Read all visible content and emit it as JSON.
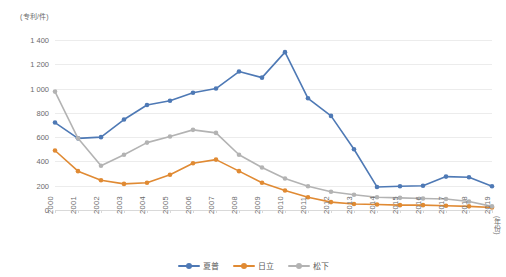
{
  "chart_data": {
    "type": "line",
    "title": "",
    "xlabel": "(年份)",
    "ylabel": "(专利/件)",
    "ylim": [
      0,
      1400
    ],
    "yticks": [
      "0",
      "200",
      "400",
      "600",
      "800",
      "1 000",
      "1 200",
      "1 400"
    ],
    "ytick_values": [
      0,
      200,
      400,
      600,
      800,
      1000,
      1200,
      1400
    ],
    "grid": true,
    "legend_position": "bottom-center",
    "categories": [
      "2000",
      "2001",
      "2002",
      "2003",
      "2004",
      "2005",
      "2006",
      "2007",
      "2008",
      "2009",
      "2010",
      "2011",
      "2012",
      "2013",
      "2014",
      "2015",
      "2016",
      "2017",
      "2018",
      "2019"
    ],
    "series": [
      {
        "name": "夏普",
        "color": "#4E79B5",
        "values": [
          720,
          590,
          600,
          745,
          865,
          900,
          965,
          1000,
          1140,
          1090,
          1300,
          920,
          775,
          500,
          190,
          195,
          200,
          275,
          270,
          195
        ]
      },
      {
        "name": "日立",
        "color": "#E08A33",
        "values": [
          490,
          320,
          245,
          215,
          225,
          290,
          385,
          415,
          320,
          225,
          160,
          105,
          65,
          50,
          45,
          40,
          40,
          35,
          30,
          20
        ]
      },
      {
        "name": "松下",
        "color": "#B3B3B3",
        "values": [
          975,
          590,
          365,
          455,
          555,
          605,
          660,
          635,
          455,
          350,
          260,
          195,
          150,
          125,
          105,
          100,
          95,
          90,
          70,
          30
        ]
      }
    ]
  },
  "legend": {
    "items": [
      {
        "label": "夏普"
      },
      {
        "label": "日立"
      },
      {
        "label": "松下"
      }
    ]
  }
}
